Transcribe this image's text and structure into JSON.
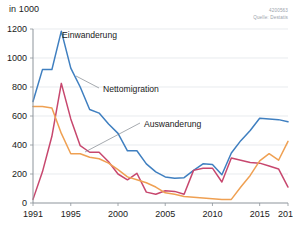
{
  "header": {
    "unit_label": "in 1000",
    "credit_id": "4200563",
    "credit_source": "Quelle: Destatis"
  },
  "annotations": {
    "immigration": "Einwanderung",
    "net": "Nettomigration",
    "emigration": "Auswanderung"
  },
  "chart_data": {
    "type": "line",
    "title": "",
    "subtitle": "",
    "xlabel": "",
    "ylabel": "in 1000",
    "ylim": [
      0,
      1200
    ],
    "xlim": [
      1991,
      2018
    ],
    "grid": true,
    "legend_position": "inline-annotations",
    "yticks": [
      0,
      200,
      400,
      600,
      800,
      1000,
      1200
    ],
    "xticks": [
      1991,
      1995,
      2000,
      2005,
      2010,
      2015,
      2018
    ],
    "x": [
      1991,
      1992,
      1993,
      1994,
      1995,
      1996,
      1997,
      1998,
      1999,
      2000,
      2001,
      2002,
      2003,
      2004,
      2005,
      2006,
      2007,
      2008,
      2009,
      2010,
      2011,
      2012,
      2013,
      2014,
      2015,
      2016,
      2017,
      2018
    ],
    "series": [
      {
        "name": "Einwanderung",
        "color": "#3f7fc0",
        "values": [
          700,
          920,
          920,
          1185,
          930,
          800,
          645,
          620,
          545,
          480,
          360,
          360,
          270,
          215,
          180,
          170,
          175,
          225,
          270,
          265,
          195,
          345,
          430,
          500,
          585,
          580,
          575,
          560
        ]
      },
      {
        "name": "Nettomigration",
        "color": "#c7476e",
        "values": [
          25,
          215,
          460,
          825,
          580,
          395,
          350,
          350,
          285,
          200,
          160,
          205,
          75,
          60,
          85,
          80,
          60,
          225,
          240,
          240,
          145,
          310,
          295,
          280,
          275,
          255,
          235,
          110
        ]
      },
      {
        "name": "Auswanderung",
        "color": "#efa052",
        "values": [
          665,
          665,
          655,
          480,
          340,
          340,
          315,
          305,
          275,
          230,
          180,
          160,
          140,
          110,
          70,
          60,
          45,
          40,
          35,
          30,
          25,
          25,
          110,
          190,
          290,
          340,
          295,
          425
        ]
      }
    ]
  }
}
